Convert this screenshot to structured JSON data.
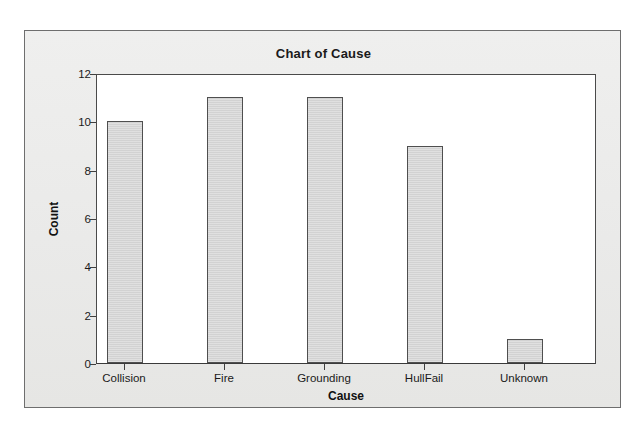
{
  "chart_data": {
    "type": "bar",
    "title": "Chart of Cause",
    "xlabel": "Cause",
    "ylabel": "Count",
    "categories": [
      "Collision",
      "Fire",
      "Grounding",
      "HullFail",
      "Unknown"
    ],
    "values": [
      10,
      11,
      11,
      9,
      1
    ],
    "ylim": [
      0,
      12
    ],
    "yticks": [
      0,
      2,
      4,
      6,
      8,
      10,
      12
    ],
    "ytick_labels": [
      "0",
      "2",
      "4",
      "6",
      "8",
      "10",
      "12"
    ],
    "grid": false,
    "legend": "none",
    "bar_fill_color": "#d2d2d2",
    "bar_edge_color": "#4f4f4f",
    "panel_background_color": "#ececeb",
    "plot_background_color": "#ffffff",
    "axis_color": "#3f3f3f",
    "text_color": "#1a1a1a"
  }
}
